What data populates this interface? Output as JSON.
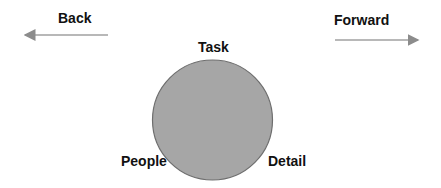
{
  "diagram": {
    "nav": {
      "back": {
        "label": "Back",
        "direction": "left"
      },
      "forward": {
        "label": "Forward",
        "direction": "right"
      }
    },
    "circle": {
      "fill": "#a6a6a6",
      "stroke": "#6e6e6e",
      "labels": {
        "top": "Task",
        "bottom_left": "People",
        "bottom_right": "Detail"
      }
    },
    "arrow_color": "#8c8c8c"
  }
}
